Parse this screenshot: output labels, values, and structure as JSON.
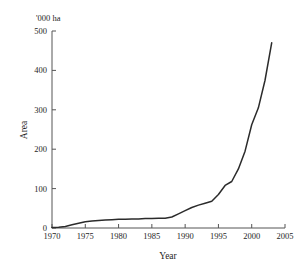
{
  "chart_data": {
    "type": "line",
    "title": "",
    "unit_label": "'000 ha",
    "xlabel": "Year",
    "ylabel": "Area",
    "xlim": [
      1970,
      2005
    ],
    "ylim": [
      0,
      500
    ],
    "grid": false,
    "legend": null,
    "xticks": [
      1970,
      1975,
      1980,
      1985,
      1990,
      1995,
      2000,
      2005
    ],
    "xtick_labels": [
      "1970",
      "1975",
      "1980",
      "1985",
      "1990",
      "1995",
      "2000",
      "2005"
    ],
    "yticks": [
      0,
      100,
      200,
      300,
      400,
      500
    ],
    "ytick_labels": [
      "0",
      "100",
      "200",
      "300",
      "400",
      "500"
    ],
    "series": [
      {
        "name": "Area",
        "color": "#2b2b2b",
        "x": [
          1970,
          1971,
          1972,
          1973,
          1974,
          1975,
          1976,
          1977,
          1978,
          1979,
          1980,
          1981,
          1982,
          1983,
          1984,
          1985,
          1986,
          1987,
          1988,
          1989,
          1990,
          1991,
          1992,
          1993,
          1994,
          1995,
          1996,
          1997,
          1998,
          1999,
          2000,
          2001,
          2002,
          2003
        ],
        "values": [
          1,
          2,
          4,
          8,
          12,
          16,
          18,
          19,
          20,
          21,
          22,
          22,
          23,
          23,
          24,
          24,
          25,
          25,
          28,
          36,
          44,
          52,
          58,
          63,
          68,
          85,
          108,
          118,
          150,
          195,
          262,
          305,
          375,
          470
        ]
      }
    ]
  }
}
